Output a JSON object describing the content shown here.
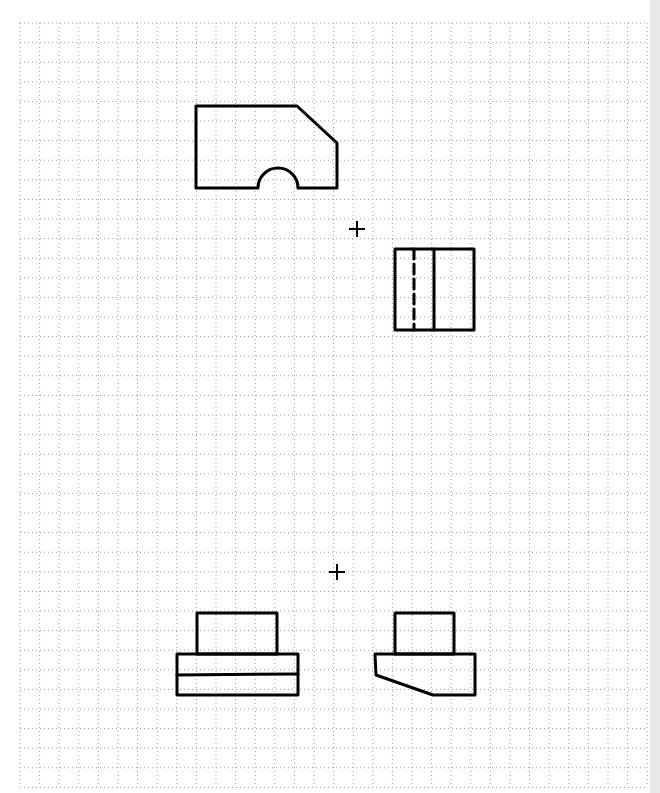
{
  "sheet": {
    "type": "dotted grid paper",
    "grid": {
      "x0": 20,
      "y0": 23,
      "pitch": 19.6,
      "cols": 32,
      "rows": 39,
      "color": "#9a9a9a"
    },
    "edge_strip_color": "#e8e8e8",
    "stroke_color": "#000000"
  },
  "figures": [
    {
      "name": "front-view-arch",
      "desc": "Pentagon with chamfered top-right corner and semicircular arch cutout at bottom"
    },
    {
      "name": "side-view-rect",
      "desc": "Rectangle with one hidden (dashed) line and one visible vertical line"
    },
    {
      "name": "front-view-stepped",
      "desc": "Small box on top of a wider base split by a horizontal line"
    },
    {
      "name": "side-view-sloped",
      "desc": "Small box on top of a base with a sloped lower-left face"
    }
  ],
  "markers": [
    {
      "name": "registration-mark-upper",
      "x": 357,
      "y": 229
    },
    {
      "name": "registration-mark-lower",
      "x": 337,
      "y": 572
    }
  ]
}
